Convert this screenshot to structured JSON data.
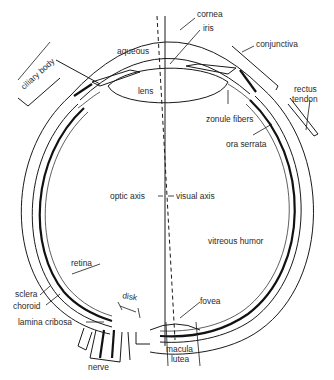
{
  "diagram": {
    "labels": {
      "cornea": "cornea",
      "iris": "iris",
      "conjunctiva": "conjunctiva",
      "aqueous": "aqueous",
      "lens": "lens",
      "ciliary_body": "ciliary body",
      "rectus_tendon_1": "rectus",
      "rectus_tendon_2": "tendon",
      "zonule_fibers": "zonule fibers",
      "ora_serrata": "ora serrata",
      "optic_axis": "optic axis",
      "visual_axis": "visual axis",
      "vitreous_humor": "vitreous humor",
      "retina": "retina",
      "sclera": "sclera",
      "choroid": "choroid",
      "disk": "disk",
      "lamina_cribosa": "lamina cribosa",
      "fovea": "fovea",
      "macula_1": "macula",
      "macula_2": "lutea",
      "nerve": "nerve"
    },
    "colors": {
      "line": "#1a1a1a",
      "text": "#2a2a2a",
      "background": "#ffffff"
    }
  }
}
